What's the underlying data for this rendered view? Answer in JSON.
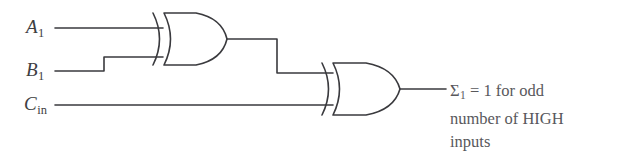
{
  "figure": {
    "name": "exclusive-or-sum-logic-diagram",
    "background_color": "#ffffff",
    "line_color": "#3a3a3e",
    "text_color": "#58585c"
  },
  "inputs": [
    {
      "id": "a1",
      "letter": "A",
      "subscript": "1",
      "label_text": "A1"
    },
    {
      "id": "b1",
      "letter": "B",
      "subscript": "1",
      "label_text": "B1"
    },
    {
      "id": "cin",
      "letter": "C",
      "subscript": "in",
      "label_text": "Cin"
    }
  ],
  "gates": [
    {
      "id": "xor-gate-1",
      "type": "XOR",
      "inputs": [
        "A1",
        "B1"
      ]
    },
    {
      "id": "xor-gate-2",
      "type": "XOR",
      "inputs": [
        "xor-gate-1",
        "Cin"
      ]
    }
  ],
  "output": {
    "symbol": "Σ",
    "subscript": "1",
    "line1_prefix": "Σ",
    "line1_rest": " = 1 for odd",
    "line2": "number of HIGH",
    "line3": "inputs"
  }
}
